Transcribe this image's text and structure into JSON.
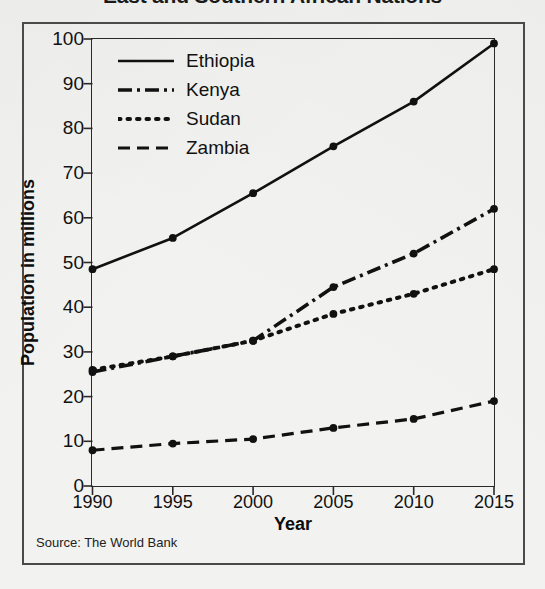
{
  "title": "East and Southern African Nations",
  "source_note": "Source: The World Bank",
  "legend": {
    "items": [
      {
        "label": "Ethiopia",
        "style": "solid"
      },
      {
        "label": "Kenya",
        "style": "dashdot"
      },
      {
        "label": "Sudan",
        "style": "dotted"
      },
      {
        "label": "Zambia",
        "style": "dashed"
      }
    ]
  },
  "axis": {
    "x_title": "Year",
    "y_title": "Population in millions",
    "x_ticks": [
      "1990",
      "1995",
      "2000",
      "2005",
      "2010",
      "2015"
    ],
    "y_ticks": [
      "0",
      "10",
      "20",
      "30",
      "40",
      "50",
      "60",
      "70",
      "80",
      "90",
      "100"
    ]
  },
  "colors": {
    "line": "#111111",
    "frame": "#2a2a2a",
    "outer_frame": "#4a4a4a",
    "paper": "#f2f2f0",
    "text": "#111111"
  },
  "chart_data": {
    "type": "line",
    "title": "East and Southern African Nations",
    "xlabel": "Year",
    "ylabel": "Population in millions",
    "x": [
      1990,
      1995,
      2000,
      2005,
      2010,
      2015
    ],
    "xlim": [
      1990,
      2015
    ],
    "ylim": [
      0,
      100
    ],
    "ytick_step": 10,
    "grid": false,
    "legend_position": "top-left inside plot",
    "markers": true,
    "source": "Source: The World Bank",
    "series": [
      {
        "name": "Ethiopia",
        "style": "solid",
        "values": [
          48.5,
          55.5,
          65.5,
          76.0,
          86.0,
          99.0
        ]
      },
      {
        "name": "Kenya",
        "style": "dashdot",
        "values": [
          25.5,
          29.0,
          32.5,
          44.5,
          52.0,
          62.0
        ]
      },
      {
        "name": "Sudan",
        "style": "dotted",
        "values": [
          26.0,
          29.0,
          32.5,
          38.5,
          43.0,
          48.5
        ]
      },
      {
        "name": "Zambia",
        "style": "dashed",
        "values": [
          8.0,
          9.5,
          10.5,
          13.0,
          15.0,
          19.0
        ]
      }
    ]
  }
}
